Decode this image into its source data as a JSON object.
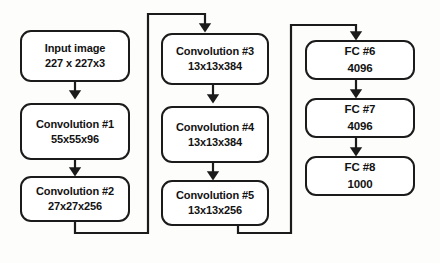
{
  "diagram": {
    "stroke_color": "#1b1b1b",
    "background_color": "#fdfdfc",
    "columns": [
      {
        "name": "left-column",
        "nodes": [
          {
            "id": "input-image",
            "line1": "Input image",
            "line2": "227 x 227x3"
          },
          {
            "id": "convolution-1",
            "line1": "Convolution #1",
            "line2": "55x55x96"
          },
          {
            "id": "convolution-2",
            "line1": "Convolution #2",
            "line2": "27x27x256"
          }
        ]
      },
      {
        "name": "middle-column",
        "nodes": [
          {
            "id": "convolution-3",
            "line1": "Convolution #3",
            "line2": "13x13x384"
          },
          {
            "id": "convolution-4",
            "line1": "Convolution #4",
            "line2": "13x13x384"
          },
          {
            "id": "convolution-5",
            "line1": "Convolution #5",
            "line2": "13x13x256"
          }
        ]
      },
      {
        "name": "right-column",
        "nodes": [
          {
            "id": "fc-6",
            "line1": "FC #6",
            "line2": "4096"
          },
          {
            "id": "fc-7",
            "line1": "FC #7",
            "line2": "4096"
          },
          {
            "id": "fc-8",
            "line1": "FC #8",
            "line2": "1000"
          }
        ]
      }
    ],
    "connectors": [
      {
        "id": "input-to-conv1",
        "from": "input-image",
        "to": "convolution-1",
        "kind": "arrow-down"
      },
      {
        "id": "conv1-to-conv2",
        "from": "convolution-1",
        "to": "convolution-2",
        "kind": "arrow-down"
      },
      {
        "id": "conv2-to-conv3",
        "from": "convolution-2",
        "to": "convolution-3",
        "kind": "wrap-around"
      },
      {
        "id": "conv3-to-conv4",
        "from": "convolution-3",
        "to": "convolution-4",
        "kind": "arrow-down"
      },
      {
        "id": "conv4-to-conv5",
        "from": "convolution-4",
        "to": "convolution-5",
        "kind": "arrow-down"
      },
      {
        "id": "conv5-to-fc6",
        "from": "convolution-5",
        "to": "fc-6",
        "kind": "wrap-around"
      },
      {
        "id": "fc6-to-fc7",
        "from": "fc-6",
        "to": "fc-7",
        "kind": "arrow-down"
      },
      {
        "id": "fc7-to-fc8",
        "from": "fc-7",
        "to": "fc-8",
        "kind": "arrow-down"
      }
    ]
  }
}
